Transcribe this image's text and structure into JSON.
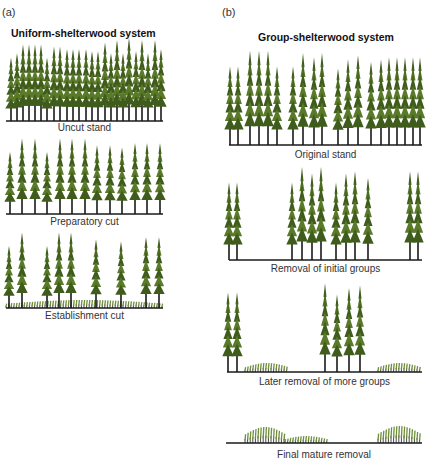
{
  "colors": {
    "foliage": "#5a7a2a",
    "foliage_dark": "#3f5c1c",
    "trunk": "#1a1a1a",
    "ground": "#1a1a1a",
    "regen": "#6f8f3a"
  },
  "panel_a": {
    "label": "(a)",
    "title": "Uniform-shelterwood system",
    "stages": [
      {
        "caption": "Uncut stand",
        "ground_y": 121,
        "x0": 6,
        "x1": 163,
        "trees": [
          [
            11,
            64
          ],
          [
            17,
            60
          ],
          [
            23,
            52
          ],
          [
            29,
            52
          ],
          [
            35,
            52
          ],
          [
            41,
            52
          ],
          [
            47,
            64
          ],
          [
            54,
            54
          ],
          [
            60,
            54
          ],
          [
            67,
            56
          ],
          [
            73,
            56
          ],
          [
            79,
            56
          ],
          [
            86,
            56
          ],
          [
            92,
            58
          ],
          [
            98,
            58
          ],
          [
            105,
            50
          ],
          [
            111,
            60
          ],
          [
            117,
            48
          ],
          [
            123,
            60
          ],
          [
            129,
            46
          ],
          [
            136,
            58
          ],
          [
            142,
            48
          ],
          [
            148,
            60
          ],
          [
            155,
            48
          ],
          [
            161,
            56
          ]
        ],
        "regen": []
      },
      {
        "caption": "Preparatory cut",
        "ground_y": 214,
        "x0": 6,
        "x1": 163,
        "trees": [
          [
            10,
            158
          ],
          [
            22,
            146
          ],
          [
            35,
            146
          ],
          [
            47,
            158
          ],
          [
            60,
            146
          ],
          [
            72,
            146
          ],
          [
            85,
            146
          ],
          [
            97,
            152
          ],
          [
            110,
            152
          ],
          [
            122,
            154
          ],
          [
            135,
            150
          ],
          [
            147,
            150
          ],
          [
            160,
            150
          ]
        ],
        "regen": []
      },
      {
        "caption": "Establishment cut",
        "ground_y": 308,
        "x0": 6,
        "x1": 163,
        "trees": [
          [
            9,
            252
          ],
          [
            22,
            240
          ],
          [
            47,
            252
          ],
          [
            59,
            240
          ],
          [
            71,
            240
          ],
          [
            96,
            246
          ],
          [
            121,
            248
          ],
          [
            146,
            244
          ],
          [
            159,
            244
          ]
        ],
        "regen": [
          [
            6,
            163,
            8
          ]
        ]
      }
    ]
  },
  "panel_b": {
    "label": "(b)",
    "title": "Group-shelterwood system",
    "stages": [
      {
        "caption": "Original stand",
        "ground_y": 145,
        "x0": 229,
        "x1": 422,
        "trees": [
          [
            230,
            74
          ],
          [
            238,
            74
          ],
          [
            250,
            60
          ],
          [
            259,
            60
          ],
          [
            268,
            60
          ],
          [
            277,
            74
          ],
          [
            293,
            74
          ],
          [
            303,
            62
          ],
          [
            314,
            66
          ],
          [
            322,
            62
          ],
          [
            338,
            76
          ],
          [
            348,
            68
          ],
          [
            358,
            64
          ],
          [
            371,
            70
          ],
          [
            381,
            68
          ],
          [
            389,
            66
          ],
          [
            397,
            66
          ],
          [
            405,
            66
          ],
          [
            413,
            66
          ],
          [
            420,
            66
          ]
        ],
        "regen": []
      },
      {
        "caption": "Removal of initial groups",
        "ground_y": 260,
        "x0": 229,
        "x1": 422,
        "trees": [
          [
            229,
            190
          ],
          [
            237,
            190
          ],
          [
            292,
            190
          ],
          [
            302,
            176
          ],
          [
            312,
            182
          ],
          [
            321,
            176
          ],
          [
            336,
            190
          ],
          [
            346,
            182
          ],
          [
            355,
            180
          ],
          [
            368,
            186
          ],
          [
            410,
            180
          ],
          [
            418,
            180
          ]
        ],
        "regen": []
      },
      {
        "caption": "Later removal of more groups",
        "ground_y": 372,
        "x0": 227,
        "x1": 422,
        "trees": [
          [
            228,
            300
          ],
          [
            237,
            300
          ],
          [
            325,
            292
          ],
          [
            337,
            302
          ],
          [
            349,
            296
          ],
          [
            360,
            294
          ]
        ],
        "regen": [
          [
            245,
            288,
            9
          ],
          [
            378,
            420,
            9
          ]
        ]
      },
      {
        "caption": "Final mature removal",
        "ground_y": 443,
        "x0": 226,
        "x1": 422,
        "trees": [],
        "regen": [
          [
            245,
            285,
            16
          ],
          [
            285,
            327,
            7
          ],
          [
            378,
            420,
            17
          ]
        ]
      }
    ]
  }
}
